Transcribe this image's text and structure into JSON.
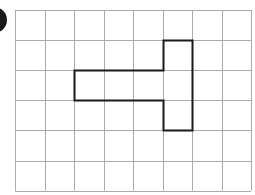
{
  "diagram": {
    "type": "square-grid",
    "columns": 8,
    "rows": 6,
    "grid_origin": [
      15,
      10
    ],
    "cell_width": 29.5,
    "cell_height": 30.1,
    "grid_line_color": "#aaaaaa",
    "shape_line_color": "#1a1a1a",
    "shape": {
      "description": "T-shaped rectilinear polygon drawn on grid",
      "filled_cells": [
        [
          2,
          2
        ],
        [
          3,
          2
        ],
        [
          4,
          2
        ],
        [
          5,
          1
        ],
        [
          5,
          2
        ],
        [
          5,
          3
        ]
      ],
      "outline_vertices_grid": [
        [
          5,
          1
        ],
        [
          6,
          1
        ],
        [
          6,
          4
        ],
        [
          5,
          4
        ],
        [
          5,
          3
        ],
        [
          2,
          3
        ],
        [
          2,
          2
        ],
        [
          5,
          2
        ]
      ]
    }
  },
  "badge": {
    "color": "#1a1a1a",
    "label": ""
  }
}
